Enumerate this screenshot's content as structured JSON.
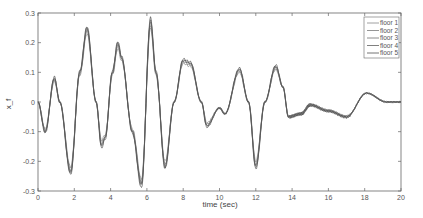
{
  "chart_data": {
    "type": "line",
    "title": "",
    "xlabel": "time (sec)",
    "ylabel": "x_f",
    "xlim": [
      0,
      20
    ],
    "ylim": [
      -0.3,
      0.3
    ],
    "xticks": [
      0,
      2,
      4,
      6,
      8,
      10,
      12,
      14,
      16,
      18,
      20
    ],
    "yticks": [
      -0.3,
      -0.2,
      -0.1,
      0,
      0.1,
      0.2,
      0.3
    ],
    "grid": false,
    "legend_position": "upper right",
    "legend": [
      "floor 1",
      "floor 2",
      "floor 3",
      "floor 4",
      "floor 5"
    ],
    "x": [
      0,
      0.4,
      0.9,
      1.2,
      1.8,
      2.3,
      2.7,
      3.2,
      3.5,
      3.7,
      4.1,
      4.4,
      4.6,
      5.2,
      5.7,
      6.2,
      6.5,
      7.0,
      7.5,
      8.0,
      8.4,
      9.0,
      9.3,
      10.0,
      10.3,
      11.1,
      11.6,
      12.0,
      12.5,
      13.1,
      13.5,
      13.8,
      14.5,
      15.0,
      16.0,
      17.0,
      18.1,
      19.2,
      20.0
    ],
    "series": [
      {
        "name": "floor 1",
        "values": [
          0,
          -0.09,
          0.07,
          0,
          -0.22,
          0.09,
          0.23,
          0,
          -0.13,
          -0.11,
          0.09,
          0.18,
          0.14,
          -0.09,
          -0.26,
          0.25,
          0.09,
          -0.2,
          0,
          0.13,
          0.12,
          0,
          -0.07,
          -0.02,
          -0.04,
          0.1,
          0,
          -0.2,
          0,
          0.11,
          0.05,
          -0.05,
          -0.04,
          -0.01,
          -0.03,
          -0.05,
          0.03,
          0,
          0
        ]
      },
      {
        "name": "floor 2",
        "values": [
          0,
          -0.095,
          0.075,
          0,
          -0.23,
          0.095,
          0.24,
          0,
          -0.14,
          -0.115,
          0.095,
          0.19,
          0.145,
          -0.095,
          -0.27,
          0.26,
          0.095,
          -0.21,
          0,
          0.135,
          0.125,
          0,
          -0.075,
          -0.02,
          -0.04,
          0.105,
          0,
          -0.21,
          0,
          0.115,
          0.05,
          -0.05,
          -0.04,
          -0.01,
          -0.03,
          -0.05,
          0.03,
          0,
          0
        ]
      },
      {
        "name": "floor 3",
        "values": [
          0,
          -0.1,
          0.08,
          0,
          -0.235,
          0.1,
          0.245,
          0,
          -0.145,
          -0.12,
          0.1,
          0.195,
          0.15,
          -0.1,
          -0.275,
          0.27,
          0.1,
          -0.215,
          0,
          0.14,
          0.13,
          0,
          -0.08,
          -0.02,
          -0.04,
          0.11,
          0,
          -0.215,
          0,
          0.12,
          0.05,
          -0.05,
          -0.04,
          -0.01,
          -0.03,
          -0.05,
          0.03,
          0,
          0
        ]
      },
      {
        "name": "floor 4",
        "values": [
          0,
          -0.1,
          0.08,
          0,
          -0.24,
          0.1,
          0.25,
          0,
          -0.15,
          -0.12,
          0.1,
          0.2,
          0.15,
          -0.1,
          -0.28,
          0.275,
          0.1,
          -0.22,
          0,
          0.14,
          0.13,
          0,
          -0.08,
          -0.02,
          -0.04,
          0.11,
          0,
          -0.22,
          0,
          0.12,
          0.05,
          -0.05,
          -0.04,
          -0.01,
          -0.03,
          -0.05,
          0.03,
          0,
          0
        ]
      },
      {
        "name": "floor 5",
        "values": [
          0,
          -0.105,
          0.085,
          0,
          -0.245,
          0.105,
          0.255,
          0,
          -0.155,
          -0.125,
          0.105,
          0.205,
          0.155,
          -0.105,
          -0.29,
          0.285,
          0.105,
          -0.225,
          0,
          0.145,
          0.135,
          0,
          -0.085,
          -0.02,
          -0.04,
          0.115,
          0,
          -0.225,
          0,
          0.125,
          0.05,
          -0.05,
          -0.04,
          -0.01,
          -0.03,
          -0.05,
          0.03,
          0,
          0
        ]
      }
    ]
  },
  "colors": {
    "lines": [
      "#888888",
      "#7a7a7a",
      "#6e6e6e",
      "#5f5f5f",
      "#505050"
    ],
    "axis": "#555555"
  }
}
